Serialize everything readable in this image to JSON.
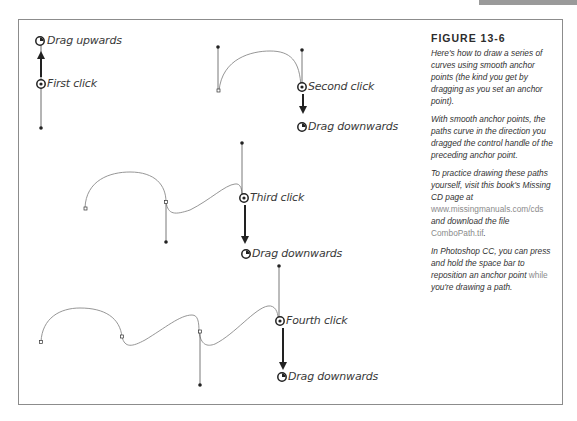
{
  "figure": {
    "title": "FIGURE 13-6",
    "paragraphs": [
      {
        "text": "Here's how to draw a series of curves using smooth anchor points (the kind you get by dragging as you set an anchor point)."
      },
      {
        "text": "With smooth anchor points, the paths curve in the direction you dragged the control handle of the preceding anchor point."
      }
    ],
    "practice": {
      "before": "To practice drawing these paths yourself, visit this book's Missing CD page at ",
      "url": "www.missingmanuals.com/cds",
      "middle": " and download the file ",
      "file": "ComboPath.tif",
      "after": "."
    },
    "tip": {
      "before": "In Photoshop CC, you can press and hold the space bar to reposition an anchor point ",
      "highlight": "while",
      "after": " you're drawing a path."
    }
  },
  "labels": {
    "drag_upwards": "Drag upwards",
    "first_click": "First click",
    "second_click": "Second click",
    "drag_down_1": "Drag downwards",
    "third_click": "Third click",
    "drag_down_2": "Drag downwards",
    "fourth_click": "Fourth click",
    "drag_down_3": "Drag downwards"
  },
  "colors": {
    "frame": "#8c8c8c",
    "path": "#8a8a8a",
    "ink": "#222222",
    "tab": "#9a9a9a"
  }
}
